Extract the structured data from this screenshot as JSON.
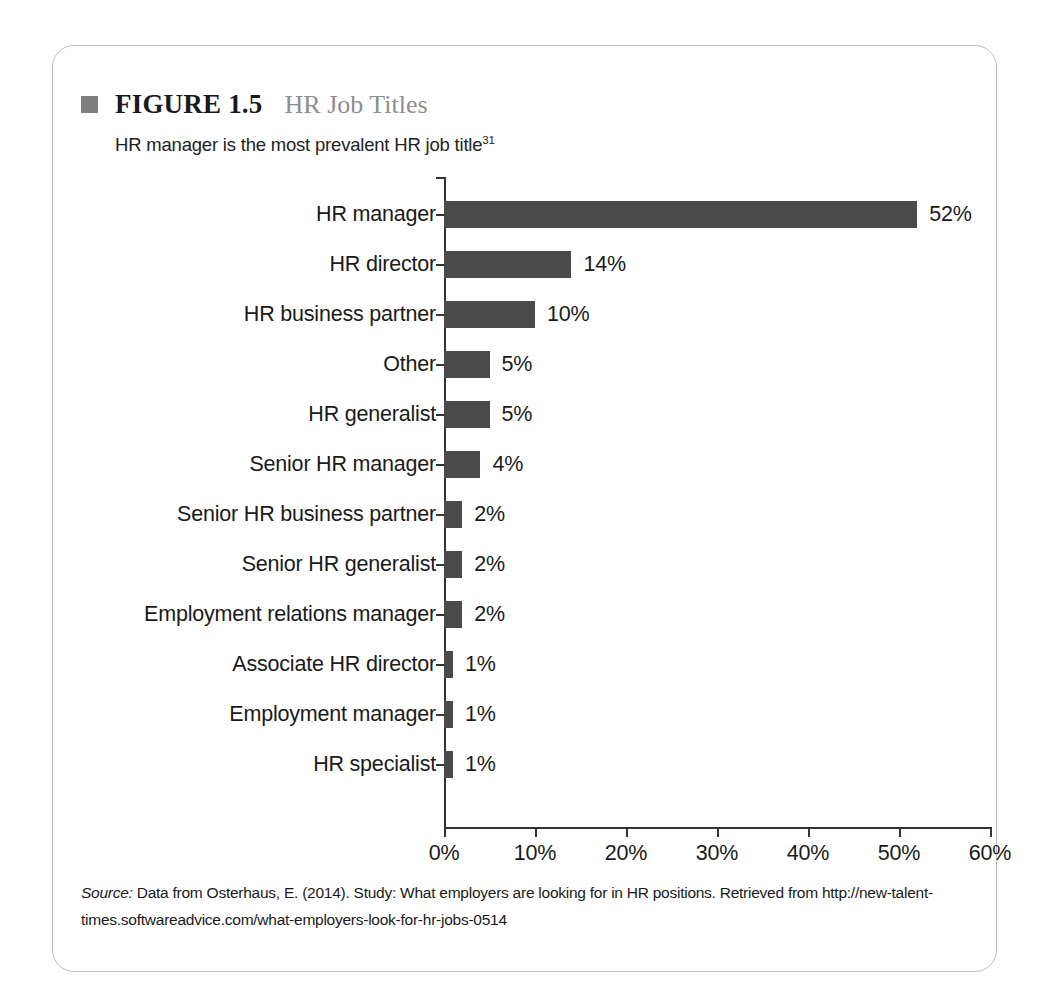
{
  "figure": {
    "bullet_color": "#7f7f7f",
    "number": "FIGURE 1.5",
    "title": "HR Job Titles",
    "subtitle": "HR manager is the most prevalent HR job title",
    "subtitle_footnote": "31"
  },
  "source": {
    "label": "Source:",
    "text": " Data from Osterhaus, E. (2014). Study: What employers are looking for in HR positions. Retrieved from http://new-talent-times.softwareadvice.com/what-employers-look-for-hr-jobs-0514"
  },
  "chart_data": {
    "type": "bar",
    "orientation": "horizontal",
    "title": "HR Job Titles",
    "subtitle": "HR manager is the most prevalent HR job title",
    "xlabel": "",
    "ylabel": "",
    "xlim": [
      0,
      60
    ],
    "grid": false,
    "legend": null,
    "bar_color": "#4a4a4a",
    "xticks": [
      "0%",
      "10%",
      "20%",
      "30%",
      "40%",
      "50%",
      "60%"
    ],
    "xtick_values": [
      0,
      10,
      20,
      30,
      40,
      50,
      60
    ],
    "categories": [
      "HR manager",
      "HR director",
      "HR business partner",
      "Other",
      "HR generalist",
      "Senior HR manager",
      "Senior HR business partner",
      "Senior HR generalist",
      "Employment relations manager",
      "Associate HR director",
      "Employment manager",
      "HR specialist"
    ],
    "values": [
      52,
      14,
      10,
      5,
      5,
      4,
      2,
      2,
      2,
      1,
      1,
      1
    ],
    "data_labels": [
      "52%",
      "14%",
      "10%",
      "5%",
      "5%",
      "4%",
      "2%",
      "2%",
      "2%",
      "1%",
      "1%",
      "1%"
    ]
  }
}
